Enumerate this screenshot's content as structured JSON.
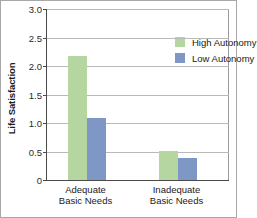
{
  "chart_data": {
    "type": "bar",
    "title": "",
    "xlabel": "",
    "ylabel": "Life Satisfaction",
    "categories": [
      "Adequate Basic Needs",
      "Inadequate Basic Needs"
    ],
    "category_lines": [
      [
        "Adequate",
        "Basic Needs"
      ],
      [
        "Inadequate",
        "Basic Needs"
      ]
    ],
    "series": [
      {
        "name": "High Autonomy",
        "color": "#b5d6a0",
        "values": [
          2.18,
          0.51
        ]
      },
      {
        "name": "Low Autonomy",
        "color": "#7f97c4",
        "values": [
          1.09,
          0.38
        ]
      }
    ],
    "ylim": [
      0,
      3.0
    ],
    "yticks": [
      0,
      0.5,
      1.0,
      1.5,
      2.0,
      2.5,
      3.0
    ],
    "ytick_labels": [
      "0",
      "0.5",
      "1.0",
      "1.5",
      "2.0",
      "2.5",
      "3.0"
    ],
    "grid": "horizontal",
    "legend_position": "upper-right-inside",
    "frame_color": "#a8a8a8",
    "axis_color": "#4a4a4a",
    "gridline_color": "#b9b9b9"
  }
}
